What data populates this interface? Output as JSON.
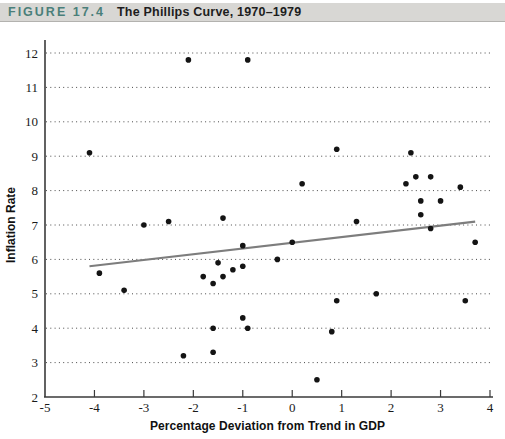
{
  "figure_header": {
    "label": "FIGURE 17.4",
    "title": "The Phillips Curve, 1970–1979",
    "label_color": "#4a7f7a",
    "bar_background": "#d8d7d4"
  },
  "chart_data": {
    "type": "scatter",
    "title": "The Phillips Curve, 1970–1979",
    "xlabel": "Percentage Deviation from Trend in GDP",
    "ylabel": "Inflation Rate",
    "xlim": [
      -5,
      4
    ],
    "ylim": [
      2,
      12
    ],
    "x_ticks": [
      -5,
      -4,
      -3,
      -2,
      -1,
      0,
      1,
      2,
      3,
      4
    ],
    "y_ticks": [
      2,
      3,
      4,
      5,
      6,
      7,
      8,
      9,
      10,
      11,
      12
    ],
    "grid": "horizontal-dotted",
    "legend": "none",
    "point_color": "#141414",
    "axis_color": "#3a3a3a",
    "trend_line": {
      "color": "#7d7d7d",
      "x1": -4.1,
      "y1": 5.8,
      "x2": 3.7,
      "y2": 7.1
    },
    "points": [
      [
        -4.1,
        9.1
      ],
      [
        -3.9,
        5.6
      ],
      [
        -3.4,
        5.1
      ],
      [
        -3.0,
        7.0
      ],
      [
        -2.5,
        7.1
      ],
      [
        -2.2,
        3.2
      ],
      [
        -2.1,
        11.8
      ],
      [
        -1.8,
        5.5
      ],
      [
        -1.6,
        5.3
      ],
      [
        -1.6,
        4.0
      ],
      [
        -1.6,
        3.3
      ],
      [
        -1.5,
        5.9
      ],
      [
        -1.4,
        7.2
      ],
      [
        -1.4,
        5.5
      ],
      [
        -1.2,
        5.7
      ],
      [
        -1.0,
        6.4
      ],
      [
        -1.0,
        5.8
      ],
      [
        -1.0,
        4.3
      ],
      [
        -0.9,
        11.8
      ],
      [
        -0.9,
        4.0
      ],
      [
        -0.3,
        6.0
      ],
      [
        0.0,
        6.5
      ],
      [
        0.2,
        8.2
      ],
      [
        0.5,
        2.5
      ],
      [
        0.8,
        3.9
      ],
      [
        0.9,
        9.2
      ],
      [
        0.9,
        4.8
      ],
      [
        1.3,
        7.1
      ],
      [
        1.7,
        5.0
      ],
      [
        2.3,
        8.2
      ],
      [
        2.4,
        9.1
      ],
      [
        2.5,
        8.4
      ],
      [
        2.6,
        7.7
      ],
      [
        2.6,
        7.3
      ],
      [
        2.8,
        8.4
      ],
      [
        2.8,
        6.9
      ],
      [
        3.0,
        7.7
      ],
      [
        3.4,
        8.1
      ],
      [
        3.5,
        4.8
      ],
      [
        3.7,
        6.5
      ]
    ]
  }
}
